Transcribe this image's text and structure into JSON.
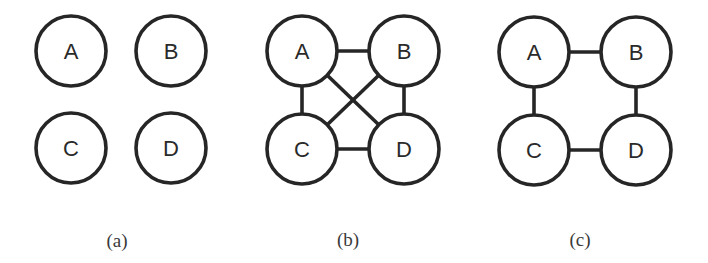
{
  "diagram": {
    "panels": [
      {
        "caption": "(a)",
        "nodes": [
          {
            "id": "A",
            "label": "A"
          },
          {
            "id": "B",
            "label": "B"
          },
          {
            "id": "C",
            "label": "C"
          },
          {
            "id": "D",
            "label": "D"
          }
        ],
        "edges": []
      },
      {
        "caption": "(b)",
        "nodes": [
          {
            "id": "A",
            "label": "A"
          },
          {
            "id": "B",
            "label": "B"
          },
          {
            "id": "C",
            "label": "C"
          },
          {
            "id": "D",
            "label": "D"
          }
        ],
        "edges": [
          [
            "A",
            "B"
          ],
          [
            "A",
            "C"
          ],
          [
            "A",
            "D"
          ],
          [
            "B",
            "C"
          ],
          [
            "B",
            "D"
          ],
          [
            "C",
            "D"
          ]
        ]
      },
      {
        "caption": "(c)",
        "nodes": [
          {
            "id": "A",
            "label": "A"
          },
          {
            "id": "B",
            "label": "B"
          },
          {
            "id": "C",
            "label": "C"
          },
          {
            "id": "D",
            "label": "D"
          }
        ],
        "edges": [
          [
            "A",
            "B"
          ],
          [
            "A",
            "C"
          ],
          [
            "B",
            "D"
          ],
          [
            "C",
            "D"
          ]
        ]
      }
    ],
    "colors": {
      "stroke": "#262626",
      "fill": "#ffffff",
      "text": "#2a2a2a"
    }
  }
}
